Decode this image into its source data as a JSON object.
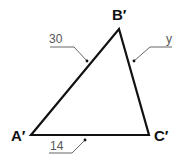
{
  "diagram": {
    "type": "triangle",
    "vertices": [
      {
        "id": "A",
        "label": "A′",
        "x": 31,
        "y": 135
      },
      {
        "id": "B",
        "label": "B′",
        "x": 119,
        "y": 29
      },
      {
        "id": "C",
        "label": "C′",
        "x": 149,
        "y": 135
      }
    ],
    "sides": [
      {
        "id": "AB",
        "label": "30"
      },
      {
        "id": "BC",
        "label": "y"
      },
      {
        "id": "AC",
        "label": "14"
      }
    ],
    "colors": {
      "triangle_stroke": "#111111",
      "leader_line": "#666666",
      "label_text": "#555555"
    }
  }
}
